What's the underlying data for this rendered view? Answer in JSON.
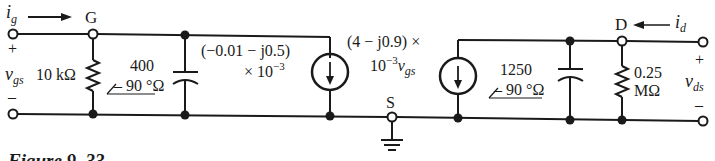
{
  "figure": {
    "caption": "Figure 9–33"
  },
  "nodes": {
    "gate": "G",
    "source": "S",
    "drain": "D"
  },
  "input_port": {
    "current_label": "i",
    "current_sub": "g",
    "voltage_label": "v",
    "voltage_sub": "gs",
    "plus": "+",
    "minus": "–"
  },
  "output_port": {
    "current_label": "i",
    "current_sub": "d",
    "voltage_label": "v",
    "voltage_sub": "ds",
    "plus": "+",
    "minus": "–"
  },
  "components": {
    "r_gs": {
      "value": "10 kΩ"
    },
    "c_gs": {
      "line1": "400",
      "line2": "– 90 °Ω",
      "angle_symbol": "∠"
    },
    "source1": {
      "line1": "(−0.01 − j0.5)",
      "line2": "× 10",
      "exp": "−3"
    },
    "source2": {
      "line1": "(4  −  j0.9) ×",
      "line2": "10",
      "exp": "−3",
      "var": "v",
      "var_sub": "gs"
    },
    "c_ds": {
      "line1": "1250",
      "line2": "– 90 °Ω"
    },
    "r_ds": {
      "line1": "0.25",
      "line2": "MΩ"
    }
  }
}
